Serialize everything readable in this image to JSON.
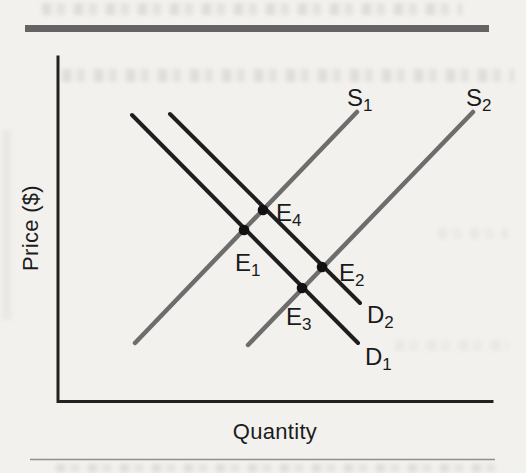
{
  "figure": {
    "background_color": "#f2f1ee",
    "top_rule_color": "#646464",
    "bottom_rule_color": "#8f8f8f"
  },
  "chart_data": {
    "type": "line",
    "subtype": "supply-demand-equilibrium-diagram",
    "title": "",
    "xlabel": "Quantity",
    "ylabel": "Price ($)",
    "axes_numeric": false,
    "grid": false,
    "axis_color": "#222222",
    "plot_area_px": {
      "x_axis_y": 401.5,
      "y_axis_x": 58,
      "x_end": 492,
      "y_top": 57
    },
    "series": [
      {
        "label": "S",
        "sub": "1",
        "kind": "supply",
        "color": "#6d6d6d",
        "width": 4.5,
        "x1": 135,
        "y1": 343,
        "x2": 357,
        "y2": 112,
        "label_x": 347,
        "label_y": 106
      },
      {
        "label": "S",
        "sub": "2",
        "kind": "supply",
        "color": "#6d6d6d",
        "width": 4.5,
        "x1": 248,
        "y1": 345,
        "x2": 473,
        "y2": 112,
        "label_x": 466,
        "label_y": 106
      },
      {
        "label": "D",
        "sub": "1",
        "kind": "demand",
        "color": "#1e1e1e",
        "width": 4,
        "x1": 132,
        "y1": 115,
        "x2": 358,
        "y2": 343,
        "label_x": 365,
        "label_y": 365
      },
      {
        "label": "D",
        "sub": "2",
        "kind": "demand",
        "color": "#1e1e1e",
        "width": 4,
        "x1": 170,
        "y1": 114,
        "x2": 360,
        "y2": 303,
        "label_x": 367,
        "label_y": 323
      }
    ],
    "points": [
      {
        "label": "E",
        "sub": "1",
        "at": "D1 x S1",
        "x": 244,
        "y": 230,
        "label_x": 235,
        "label_y": 271
      },
      {
        "label": "E",
        "sub": "2",
        "at": "D2 x S2",
        "x": 322,
        "y": 267,
        "label_x": 339,
        "label_y": 281
      },
      {
        "label": "E",
        "sub": "3",
        "at": "D1 x S2",
        "x": 302,
        "y": 288,
        "label_x": 286,
        "label_y": 325
      },
      {
        "label": "E",
        "sub": "4",
        "at": "D2 x S1",
        "x": 263,
        "y": 210,
        "label_x": 276,
        "label_y": 221
      }
    ],
    "point_color": "#111111",
    "point_radius": 5.3
  }
}
